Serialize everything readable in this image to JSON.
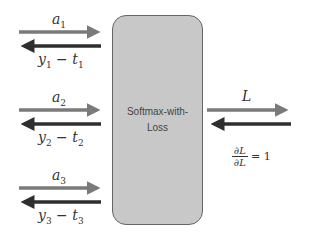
{
  "diagram": {
    "node": {
      "label": "Softmax-with-Loss"
    },
    "inputs": [
      {
        "forward": "a",
        "forward_sub": "1",
        "backward": "y",
        "backward_sub": "1",
        "backward_op": " − ",
        "backward_t": "t",
        "backward_t_sub": "1"
      },
      {
        "forward": "a",
        "forward_sub": "2",
        "backward": "y",
        "backward_sub": "2",
        "backward_op": " − ",
        "backward_t": "t",
        "backward_t_sub": "2"
      },
      {
        "forward": "a",
        "forward_sub": "3",
        "backward": "y",
        "backward_sub": "3",
        "backward_op": " − ",
        "backward_t": "t",
        "backward_t_sub": "3"
      }
    ],
    "output": {
      "forward": "L",
      "backward_num": "∂L",
      "backward_den": "∂L",
      "backward_eq": "= 1"
    },
    "colors": {
      "forward_arrow": "#7a7a7a",
      "backward_arrow": "#2e2e2e",
      "node_fill": "#c8c8c8",
      "node_border": "#666666"
    }
  }
}
